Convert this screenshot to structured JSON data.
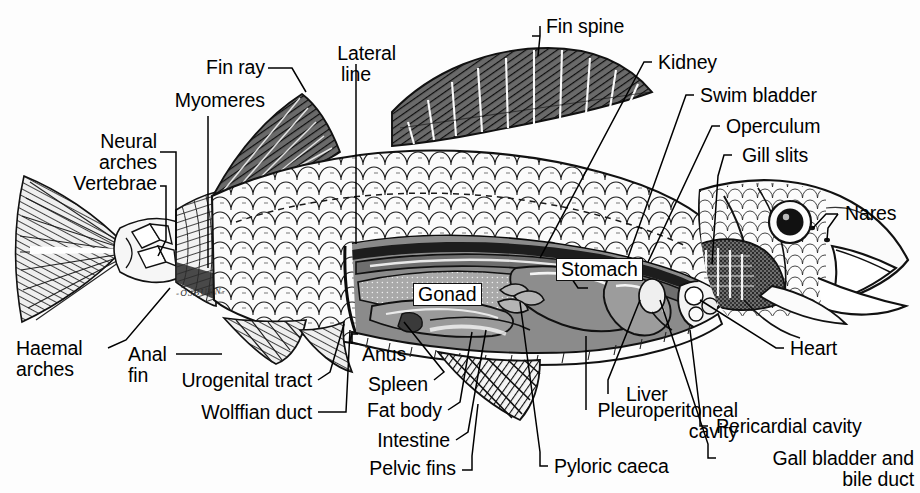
{
  "figure": {
    "signature": "-OSBURN-",
    "background_color": "#fdfdfd",
    "ink_color": "#000000"
  },
  "labels": {
    "lateral_line": "Lateral\nline",
    "fin_ray": "Fin ray",
    "myomeres": "Myomeres",
    "neural_arches": "Neural\narches",
    "vertebrae": "Vertebrae",
    "fin_spine": "Fin spine",
    "kidney": "Kidney",
    "swim_bladder": "Swim bladder",
    "operculum": "Operculum",
    "gill_slits": "Gill slits",
    "nares": "Nares",
    "haemal_arches": "Haemal\narches",
    "anal_fin": "Anal\nfin",
    "urogenital_tract": "Urogenital tract",
    "wolffian_duct": "Wolffian duct",
    "anus": "Anus",
    "spleen": "Spleen",
    "fat_body": "Fat body",
    "intestine": "Intestine",
    "pelvic_fins": "Pelvic fins",
    "pyloric_caeca": "Pyloric caeca",
    "pleuroperitoneal_cavity": "Pleuroperitoneal\ncavity",
    "liver": "Liver",
    "gall_bladder": "Gall bladder and\nbile duct",
    "pericardial_cavity": "Pericardial cavity",
    "heart": "Heart",
    "gonad": "Gonad",
    "stomach": "Stomach"
  },
  "label_list": [
    "Lateral line",
    "Fin ray",
    "Myomeres",
    "Neural arches",
    "Vertebrae",
    "Fin spine",
    "Kidney",
    "Swim bladder",
    "Operculum",
    "Gill slits",
    "Nares",
    "Haemal arches",
    "Anal fin",
    "Urogenital tract",
    "Wolffian duct",
    "Anus",
    "Spleen",
    "Fat body",
    "Intestine",
    "Pelvic fins",
    "Pyloric caeca",
    "Pleuroperitoneal cavity",
    "Liver",
    "Gall bladder and bile duct",
    "Pericardial cavity",
    "Heart",
    "Gonad",
    "Stomach"
  ]
}
